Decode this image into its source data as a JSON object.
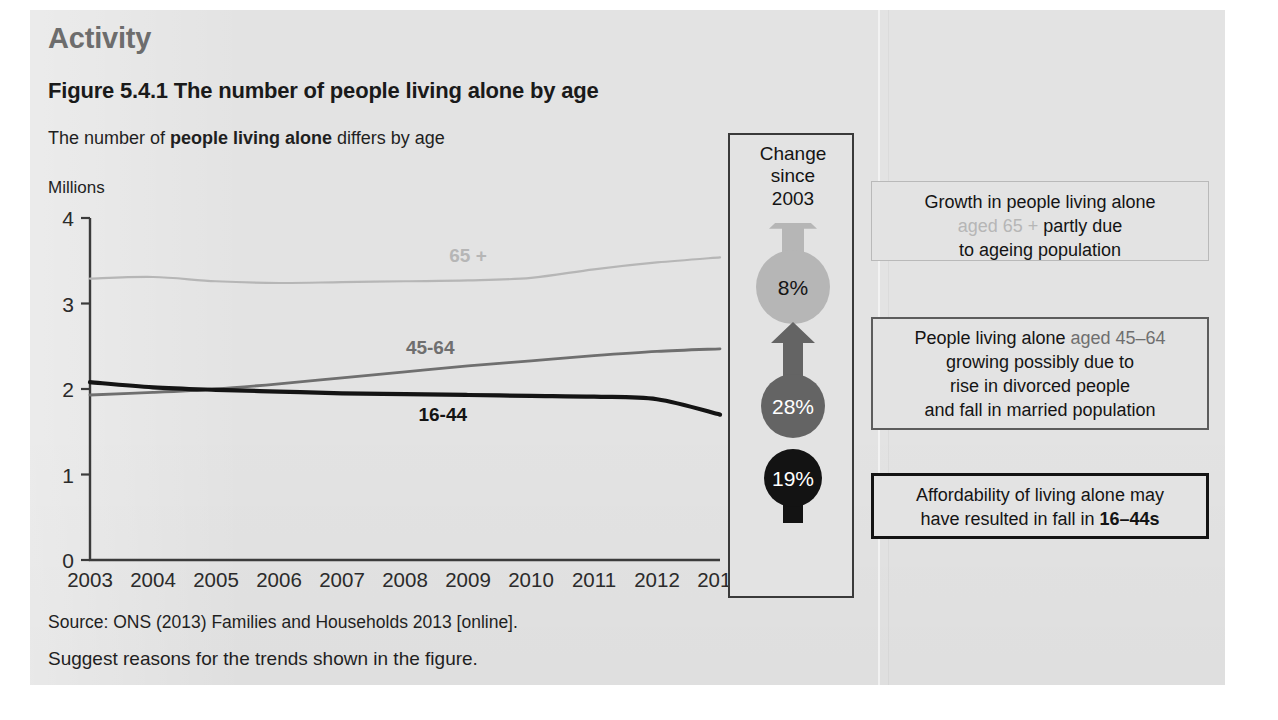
{
  "header": {
    "activity_label": "Activity",
    "figure_title": "Figure 5.4.1 The number of people living alone by age",
    "subtitle_pre": "The number of ",
    "subtitle_bold": "people living alone",
    "subtitle_post": " differs by age"
  },
  "chart_data": {
    "type": "line",
    "title": "The number of people living alone differs by age",
    "xlabel": "",
    "ylabel": "Millions",
    "ylim": [
      0,
      4
    ],
    "yticks": [
      "0",
      "1",
      "2",
      "3",
      "4"
    ],
    "grid": false,
    "legend": "inline-labels",
    "x": [
      2003,
      2004,
      2005,
      2006,
      2007,
      2008,
      2009,
      2010,
      2011,
      2012,
      2013
    ],
    "categories": [
      "2003",
      "2004",
      "2005",
      "2006",
      "2007",
      "2008",
      "2009",
      "2010",
      "2011",
      "2012",
      "2013"
    ],
    "series": [
      {
        "name": "65 +",
        "label": "65 +",
        "color": "#b6b6b6",
        "values": [
          3.29,
          3.31,
          3.26,
          3.24,
          3.25,
          3.26,
          3.27,
          3.3,
          3.4,
          3.48,
          3.54
        ]
      },
      {
        "name": "45-64",
        "label": "45-64",
        "color": "#6f6f6f",
        "values": [
          1.93,
          1.96,
          2.0,
          2.06,
          2.13,
          2.2,
          2.27,
          2.33,
          2.39,
          2.44,
          2.47
        ]
      },
      {
        "name": "16-44",
        "label": "16-44",
        "color": "#141414",
        "values": [
          2.08,
          2.02,
          1.99,
          1.97,
          1.95,
          1.94,
          1.93,
          1.92,
          1.91,
          1.88,
          1.7
        ]
      }
    ]
  },
  "change_panel": {
    "heading_line1": "Change",
    "heading_line2": "since",
    "heading_line3": "2003",
    "items": [
      {
        "value": "8%",
        "direction": "up",
        "color": "#b6b6b6",
        "text_color": "#141414"
      },
      {
        "value": "28%",
        "direction": "up",
        "color": "#646464",
        "text_color": "#ffffff"
      },
      {
        "value": "19%",
        "direction": "down",
        "color": "#131313",
        "text_color": "#ffffff"
      }
    ]
  },
  "callouts": [
    {
      "line1_a": "Growth in people living alone",
      "line2_pre": "",
      "line2_accent": "aged 65 +",
      "line2_post": " partly due",
      "line3": "to ageing population",
      "accent_color": "#b6b6b6"
    },
    {
      "line1_pre": "People living alone ",
      "line1_accent": "aged 45–64",
      "line2": "growing possibly due to",
      "line3": "rise in divorced people",
      "line4": "and fall in married population",
      "accent_color": "#6f6f6f"
    },
    {
      "line1": "Affordability of living alone may",
      "line2_pre": "have resulted in fall in ",
      "line2_accent": "16–44s",
      "accent_color": "#141414"
    }
  ],
  "footer": {
    "source": "Source: ONS (2013) Families and Households 2013 [online].",
    "task": "Suggest reasons for the trends shown in the figure."
  }
}
